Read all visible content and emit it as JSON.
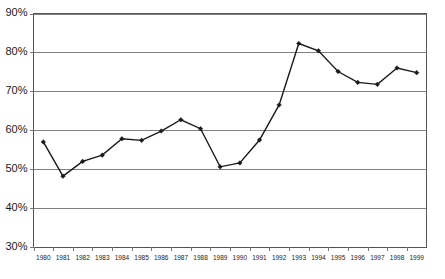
{
  "chart_data": {
    "type": "line",
    "title": "",
    "subtitle": "",
    "xlabel": "",
    "ylabel": "",
    "grid": true,
    "legend": "none",
    "xlim": [
      1980,
      1999
    ],
    "ylim": [
      30,
      90
    ],
    "ytick_step": 10,
    "ytick_labels": [
      "90%",
      "80%",
      "70%",
      "60%",
      "50%",
      "40%",
      "30%"
    ],
    "ytick_values": [
      90,
      80,
      70,
      60,
      50,
      40,
      30
    ],
    "categories": [
      "1980",
      "1981",
      "1982",
      "1983",
      "1984",
      "1985",
      "1986",
      "1987",
      "1988",
      "1989",
      "1990",
      "1991",
      "1992",
      "1993",
      "1994",
      "1995",
      "1996",
      "1997",
      "1998",
      "1999"
    ],
    "x": [
      1980,
      1981,
      1982,
      1983,
      1984,
      1985,
      1986,
      1987,
      1988,
      1989,
      1990,
      1991,
      1992,
      1993,
      1994,
      1995,
      1996,
      1997,
      1998,
      1999
    ],
    "values": [
      57.0,
      48.2,
      52.0,
      53.6,
      57.8,
      57.4,
      59.8,
      62.7,
      60.4,
      50.6,
      51.6,
      57.5,
      66.5,
      82.3,
      80.4,
      75.1,
      72.3,
      71.8,
      76.0,
      74.8
    ],
    "series": [
      {
        "name": "series-1",
        "marker": "diamond",
        "color": "#1a1a1a",
        "values": [
          57.0,
          48.2,
          52.0,
          53.6,
          57.8,
          57.4,
          59.8,
          62.7,
          60.4,
          50.6,
          51.6,
          57.5,
          66.5,
          82.3,
          80.4,
          75.1,
          72.3,
          71.8,
          76.0,
          74.8
        ]
      }
    ],
    "annotations": []
  },
  "colors": {
    "line": "#1a1a1a",
    "marker": "#1a1a1a",
    "grid": "#808080",
    "frame": "#555555",
    "background": "#ffffff",
    "text": "#1a1a1a"
  }
}
